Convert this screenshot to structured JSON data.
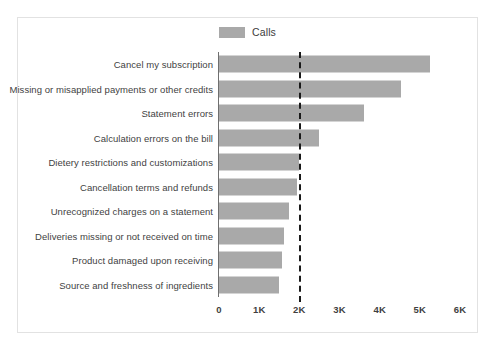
{
  "legend": {
    "swatch_name": "calls-legend-swatch",
    "label": "Calls",
    "color": "#a9a9a9"
  },
  "axis": {
    "ticks": [
      "0",
      "1K",
      "2K",
      "3K",
      "4K",
      "5K",
      "6K"
    ],
    "tick_values": [
      0,
      1000,
      2000,
      3000,
      4000,
      5000,
      6000
    ]
  },
  "reference_line": {
    "label": "2K",
    "value": 2000,
    "style": "dashed",
    "color": "#1a1a1a"
  },
  "chart_data": {
    "type": "bar",
    "orientation": "horizontal",
    "title": "",
    "subtitle": "",
    "xlabel": "",
    "ylabel": "",
    "xlim": [
      0,
      6000
    ],
    "grid": false,
    "legend_position": "top-center",
    "categories": [
      "Cancel my subscription",
      "Missing or misapplied payments or other credits",
      "Statement errors",
      "Calculation errors on the bill",
      "Dietery restrictions and customizations",
      "Cancellation terms and refunds",
      "Unrecognized charges on a statement",
      "Deliveries missing or not received on time",
      "Product damaged upon receiving",
      "Source and freshness of ingredients"
    ],
    "series": [
      {
        "name": "Calls",
        "color": "#a9a9a9",
        "values": [
          5250,
          4520,
          3600,
          2480,
          2000,
          1950,
          1740,
          1610,
          1570,
          1500
        ]
      }
    ],
    "annotations": [
      {
        "type": "vertical-reference-line",
        "value": 2000,
        "label": "2K",
        "style": "dashed"
      }
    ]
  }
}
